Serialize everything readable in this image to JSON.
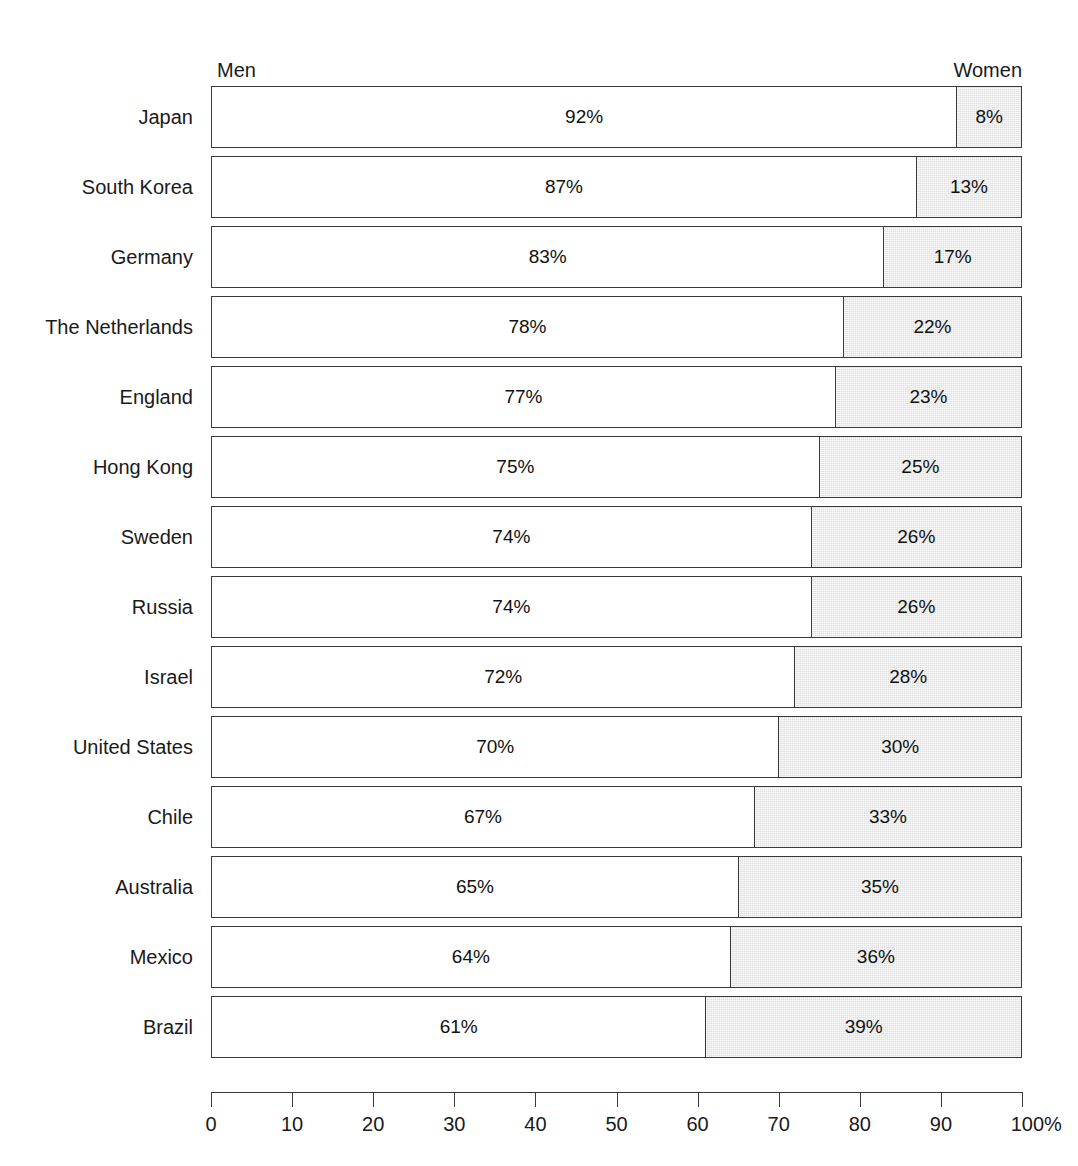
{
  "header": {
    "men_label": "Men",
    "women_label": "Women"
  },
  "axis": {
    "ticks": [
      "0",
      "10",
      "20",
      "30",
      "40",
      "50",
      "60",
      "70",
      "80",
      "90",
      "100%"
    ],
    "min": 0,
    "max": 100
  },
  "colors": {
    "men_fill": "#ffffff",
    "women_fill": "#e0e0e0",
    "stroke": "#3a3a3a",
    "text": "#1a1a1a"
  },
  "chart_data": {
    "type": "bar",
    "orientation": "horizontal",
    "stacked": true,
    "normalized": true,
    "title": "",
    "subtitle": "",
    "xlabel": "",
    "ylabel": "",
    "xlim": [
      0,
      100
    ],
    "xticks": [
      0,
      10,
      20,
      30,
      40,
      50,
      60,
      70,
      80,
      90,
      100
    ],
    "xtick_labels": [
      "0",
      "10",
      "20",
      "30",
      "40",
      "50",
      "60",
      "70",
      "80",
      "90",
      "100%"
    ],
    "grid": false,
    "legend_position": "top",
    "categories": [
      "Japan",
      "South Korea",
      "Germany",
      "The Netherlands",
      "England",
      "Hong Kong",
      "Sweden",
      "Russia",
      "Israel",
      "United States",
      "Chile",
      "Australia",
      "Mexico",
      "Brazil"
    ],
    "series": [
      {
        "name": "Men",
        "values": [
          92,
          87,
          83,
          78,
          77,
          75,
          74,
          74,
          72,
          70,
          67,
          65,
          64,
          61
        ],
        "labels": [
          "92%",
          "87%",
          "83%",
          "78%",
          "77%",
          "75%",
          "74%",
          "74%",
          "72%",
          "70%",
          "67%",
          "65%",
          "64%",
          "61%"
        ]
      },
      {
        "name": "Women",
        "values": [
          8,
          13,
          17,
          22,
          23,
          25,
          26,
          26,
          28,
          30,
          33,
          35,
          36,
          39
        ],
        "labels": [
          "8%",
          "13%",
          "17%",
          "22%",
          "23%",
          "25%",
          "26%",
          "26%",
          "28%",
          "30%",
          "33%",
          "35%",
          "36%",
          "39%"
        ]
      }
    ],
    "rows": [
      {
        "category": "Japan",
        "men": 92,
        "women": 8,
        "men_label": "92%",
        "women_label": "8%"
      },
      {
        "category": "South Korea",
        "men": 87,
        "women": 13,
        "men_label": "87%",
        "women_label": "13%"
      },
      {
        "category": "Germany",
        "men": 83,
        "women": 17,
        "men_label": "83%",
        "women_label": "17%"
      },
      {
        "category": "The Netherlands",
        "men": 78,
        "women": 22,
        "men_label": "78%",
        "women_label": "22%"
      },
      {
        "category": "England",
        "men": 77,
        "women": 23,
        "men_label": "77%",
        "women_label": "23%"
      },
      {
        "category": "Hong Kong",
        "men": 75,
        "women": 25,
        "men_label": "75%",
        "women_label": "25%"
      },
      {
        "category": "Sweden",
        "men": 74,
        "women": 26,
        "men_label": "74%",
        "women_label": "26%"
      },
      {
        "category": "Russia",
        "men": 74,
        "women": 26,
        "men_label": "74%",
        "women_label": "26%"
      },
      {
        "category": "Israel",
        "men": 72,
        "women": 28,
        "men_label": "72%",
        "women_label": "28%"
      },
      {
        "category": "United States",
        "men": 70,
        "women": 30,
        "men_label": "70%",
        "women_label": "30%"
      },
      {
        "category": "Chile",
        "men": 67,
        "women": 33,
        "men_label": "67%",
        "women_label": "33%"
      },
      {
        "category": "Australia",
        "men": 65,
        "women": 35,
        "men_label": "65%",
        "women_label": "35%"
      },
      {
        "category": "Mexico",
        "men": 64,
        "women": 36,
        "men_label": "64%",
        "women_label": "36%"
      },
      {
        "category": "Brazil",
        "men": 61,
        "women": 39,
        "men_label": "61%",
        "women_label": "39%"
      }
    ]
  }
}
